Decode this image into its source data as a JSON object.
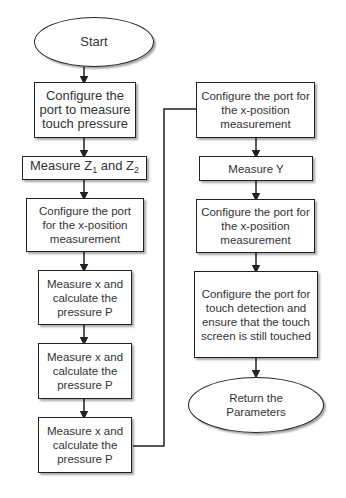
{
  "diagram": {
    "type": "flowchart",
    "nodes": [
      {
        "id": "start",
        "shape": "ellipse",
        "label": "Start"
      },
      {
        "id": "cfg-pressure",
        "shape": "rect",
        "label": "Configure the port to measure touch pressure"
      },
      {
        "id": "measure-z",
        "shape": "rect",
        "label_prefix": "Measure Z",
        "sub1": "1",
        "label_mid": " and Z",
        "sub2": "2"
      },
      {
        "id": "cfg-x1",
        "shape": "rect",
        "label": "Configure the port for the x-position measurement"
      },
      {
        "id": "measure-x1",
        "shape": "rect",
        "label": "Measure x and calculate the pressure P"
      },
      {
        "id": "measure-x2",
        "shape": "rect",
        "label": "Measure x and calculate the pressure P"
      },
      {
        "id": "measure-x3",
        "shape": "rect",
        "label": "Measure x and calculate the pressure P"
      },
      {
        "id": "cfg-x2",
        "shape": "rect",
        "label": "Configure the port for the x-position measurement"
      },
      {
        "id": "measure-y",
        "shape": "rect",
        "label": "Measure Y"
      },
      {
        "id": "cfg-x3",
        "shape": "rect",
        "label": "Configure the port for the x-position measurement"
      },
      {
        "id": "cfg-touch",
        "shape": "rect",
        "label": "Configure the port for touch detection and ensure that the touch screen is still touched"
      },
      {
        "id": "return",
        "shape": "ellipse",
        "label": "Return the Parameters"
      }
    ],
    "edges": [
      [
        "start",
        "cfg-pressure"
      ],
      [
        "cfg-pressure",
        "measure-z"
      ],
      [
        "measure-z",
        "cfg-x1"
      ],
      [
        "cfg-x1",
        "measure-x1"
      ],
      [
        "measure-x1",
        "measure-x2"
      ],
      [
        "measure-x2",
        "measure-x3"
      ],
      [
        "measure-x3",
        "cfg-x2"
      ],
      [
        "cfg-x2",
        "measure-y"
      ],
      [
        "measure-y",
        "cfg-x3"
      ],
      [
        "cfg-x3",
        "cfg-touch"
      ],
      [
        "cfg-touch",
        "return"
      ]
    ]
  }
}
